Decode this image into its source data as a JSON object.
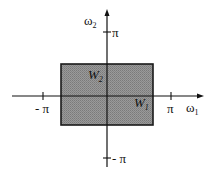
{
  "diagram": {
    "type": "frequency-plane",
    "axes": {
      "horizontal": {
        "symbol": "ω",
        "subscript": "1",
        "pos_tick": "π",
        "neg_tick": "- π"
      },
      "vertical": {
        "symbol": "ω",
        "subscript": "2",
        "pos_tick": "π",
        "neg_tick": "- π"
      }
    },
    "region": {
      "description": "shaded rectangle centered at origin",
      "fill_color": "#8c8c8c",
      "border_color": "#1a1a1a",
      "labels": [
        {
          "symbol": "W",
          "subscript": "2"
        },
        {
          "symbol": "W",
          "subscript": "1"
        }
      ]
    }
  }
}
